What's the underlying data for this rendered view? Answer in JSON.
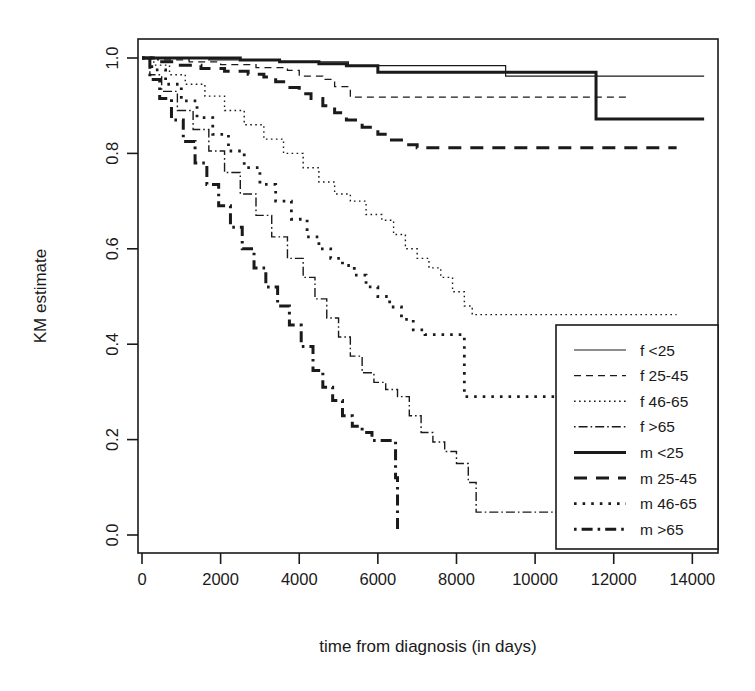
{
  "chart_data": {
    "type": "line",
    "subtype": "kaplan-meier-step",
    "title": "",
    "xlabel": "time from diagnosis (in days)",
    "ylabel": "KM estimate",
    "xlim": [
      0,
      14500
    ],
    "ylim": [
      0.0,
      1.0
    ],
    "xticks": [
      0,
      2000,
      4000,
      6000,
      8000,
      10000,
      12000,
      14000
    ],
    "xticklabels": [
      "0",
      "2000",
      "4000",
      "6000",
      "8000",
      "10000",
      "12000",
      "14000"
    ],
    "yticks": [
      0.0,
      0.2,
      0.4,
      0.6,
      0.8,
      1.0
    ],
    "yticklabels": [
      "0.0",
      "0.2",
      "0.4",
      "0.6",
      "0.8",
      "1.0"
    ],
    "grid": false,
    "legend_position": "bottom-right",
    "series": [
      {
        "name": "f <25",
        "style": "solid-thin",
        "dash": "none",
        "width": 1.2,
        "color": "#1a1a1a",
        "x": [
          0,
          300,
          900,
          1700,
          2600,
          3500,
          4300,
          5200,
          5250,
          6000,
          7000,
          8100,
          9200,
          9250,
          10400,
          11500,
          12600,
          13700,
          14300
        ],
        "y": [
          1.0,
          1.0,
          1.0,
          0.996,
          0.996,
          0.992,
          0.992,
          0.992,
          0.984,
          0.984,
          0.984,
          0.984,
          0.984,
          0.962,
          0.962,
          0.962,
          0.962,
          0.962,
          0.962
        ]
      },
      {
        "name": "f 25-45",
        "style": "dashed-thin",
        "dash": "7,5",
        "width": 1.3,
        "color": "#1a1a1a",
        "x": [
          0,
          400,
          1200,
          2000,
          2900,
          3700,
          4000,
          4600,
          4900,
          5300,
          6200,
          7200,
          8300,
          9400,
          10500,
          11500,
          12400
        ],
        "y": [
          1.0,
          0.996,
          0.992,
          0.986,
          0.98,
          0.974,
          0.962,
          0.955,
          0.94,
          0.918,
          0.918,
          0.918,
          0.918,
          0.918,
          0.918,
          0.918,
          0.918
        ]
      },
      {
        "name": "f 46-65",
        "style": "dotted-thin",
        "dash": "1.6,3.4",
        "width": 1.4,
        "color": "#1a1a1a",
        "x": [
          0,
          300,
          700,
          1100,
          1600,
          2100,
          2600,
          3100,
          3600,
          4100,
          4500,
          4900,
          5300,
          5700,
          6100,
          6400,
          6700,
          7000,
          7300,
          7600,
          7900,
          8200,
          8400,
          8500,
          9500,
          10500,
          11500,
          12500,
          13600
        ],
        "y": [
          1.0,
          0.985,
          0.965,
          0.945,
          0.92,
          0.89,
          0.86,
          0.83,
          0.8,
          0.77,
          0.74,
          0.715,
          0.7,
          0.672,
          0.66,
          0.63,
          0.6,
          0.58,
          0.56,
          0.54,
          0.51,
          0.48,
          0.462,
          0.462,
          0.462,
          0.462,
          0.462,
          0.462,
          0.462
        ]
      },
      {
        "name": "f >65",
        "style": "dashdot-thin",
        "dash": "1.6,3,9,3",
        "width": 1.4,
        "color": "#1a1a1a",
        "x": [
          0,
          200,
          500,
          900,
          1300,
          1700,
          2100,
          2500,
          2900,
          3300,
          3700,
          4100,
          4400,
          4700,
          5000,
          5300,
          5600,
          5900,
          6200,
          6500,
          6800,
          7100,
          7400,
          7700,
          8000,
          8300,
          8500,
          9000,
          10000,
          10700
        ],
        "y": [
          1.0,
          0.965,
          0.93,
          0.89,
          0.85,
          0.805,
          0.76,
          0.715,
          0.67,
          0.625,
          0.58,
          0.54,
          0.495,
          0.455,
          0.415,
          0.375,
          0.34,
          0.32,
          0.305,
          0.29,
          0.25,
          0.215,
          0.195,
          0.175,
          0.15,
          0.11,
          0.048,
          0.048,
          0.048,
          0.048
        ]
      },
      {
        "name": "m <25",
        "style": "solid-thick",
        "dash": "none",
        "width": 3.0,
        "color": "#1a1a1a",
        "x": [
          0,
          500,
          1500,
          2500,
          3500,
          4500,
          5200,
          6000,
          7000,
          8000,
          9000,
          10000,
          11000,
          11500,
          11550,
          12500,
          13500,
          14300
        ],
        "y": [
          1.0,
          1.0,
          1.0,
          0.996,
          0.992,
          0.988,
          0.984,
          0.97,
          0.97,
          0.97,
          0.97,
          0.97,
          0.97,
          0.97,
          0.872,
          0.872,
          0.872,
          0.872
        ]
      },
      {
        "name": "m 25-45",
        "style": "dashed-thick",
        "dash": "13,9",
        "width": 3.0,
        "color": "#1a1a1a",
        "x": [
          0,
          400,
          900,
          1500,
          2100,
          2700,
          3100,
          3400,
          3700,
          4000,
          4300,
          4600,
          4900,
          5200,
          5600,
          6000,
          6300,
          6600,
          7000,
          8000,
          9000,
          10000,
          11000,
          12000,
          13000,
          13600
        ],
        "y": [
          1.0,
          0.992,
          0.985,
          0.978,
          0.972,
          0.966,
          0.96,
          0.95,
          0.938,
          0.925,
          0.915,
          0.9,
          0.885,
          0.87,
          0.855,
          0.84,
          0.828,
          0.818,
          0.812,
          0.812,
          0.812,
          0.812,
          0.812,
          0.812,
          0.812,
          0.812
        ]
      },
      {
        "name": "m 46-65",
        "style": "dotted-thick",
        "dash": "2.6,6",
        "width": 2.8,
        "color": "#1a1a1a",
        "x": [
          0,
          250,
          600,
          1000,
          1400,
          1800,
          2200,
          2600,
          3000,
          3400,
          3800,
          4200,
          4500,
          4800,
          5100,
          5400,
          5700,
          6000,
          6300,
          6600,
          6900,
          7200,
          7500,
          7800,
          8100,
          8200,
          8600,
          9000,
          9400,
          10000,
          10600
        ],
        "y": [
          1.0,
          0.975,
          0.945,
          0.91,
          0.875,
          0.84,
          0.805,
          0.77,
          0.735,
          0.7,
          0.662,
          0.625,
          0.6,
          0.58,
          0.565,
          0.545,
          0.52,
          0.5,
          0.478,
          0.452,
          0.43,
          0.42,
          0.42,
          0.42,
          0.42,
          0.29,
          0.29,
          0.29,
          0.29,
          0.29,
          0.29
        ]
      },
      {
        "name": "m >65",
        "style": "dashdot-thick",
        "dash": "2.6,5,11,5",
        "width": 3.0,
        "color": "#1a1a1a",
        "x": [
          0,
          200,
          450,
          750,
          1050,
          1350,
          1650,
          1950,
          2250,
          2550,
          2850,
          3150,
          3450,
          3750,
          4050,
          4350,
          4600,
          4850,
          5100,
          5350,
          5600,
          5850,
          6100,
          6350,
          6450,
          6500
        ],
        "y": [
          1.0,
          0.955,
          0.915,
          0.87,
          0.825,
          0.78,
          0.735,
          0.69,
          0.645,
          0.6,
          0.56,
          0.52,
          0.48,
          0.44,
          0.395,
          0.345,
          0.31,
          0.282,
          0.25,
          0.228,
          0.215,
          0.198,
          0.198,
          0.198,
          0.12,
          0.012
        ]
      }
    ],
    "legend_entries": [
      {
        "label": "f <25",
        "style": "solid-thin"
      },
      {
        "label": "f 25-45",
        "style": "dashed-thin"
      },
      {
        "label": "f 46-65",
        "style": "dotted-thin"
      },
      {
        "label": "f >65",
        "style": "dashdot-thin"
      },
      {
        "label": "m <25",
        "style": "solid-thick"
      },
      {
        "label": "m 25-45",
        "style": "dashed-thick"
      },
      {
        "label": "m 46-65",
        "style": "dotted-thick"
      },
      {
        "label": "m >65",
        "style": "dashdot-thick"
      }
    ]
  }
}
